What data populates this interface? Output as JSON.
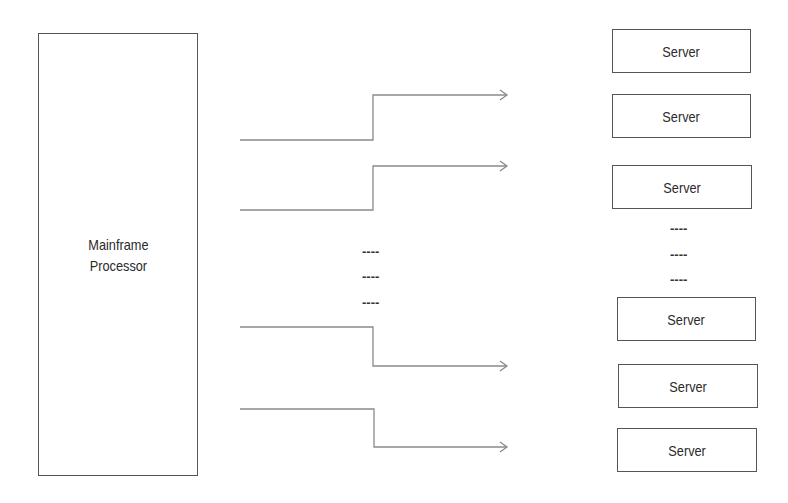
{
  "mainframe": {
    "label_line1": "Mainframe",
    "label_line2": "Processor"
  },
  "servers": [
    {
      "label": "Server"
    },
    {
      "label": "Server"
    },
    {
      "label": "Server"
    },
    {
      "label": "Server"
    },
    {
      "label": "Server"
    },
    {
      "label": "Server"
    }
  ],
  "ellipsis": {
    "middle": [
      "----",
      "----",
      "----"
    ],
    "right": [
      "----",
      "----",
      "----"
    ]
  },
  "connectors": [
    {
      "from": "mainframe",
      "to": "server",
      "direction": "up"
    },
    {
      "from": "mainframe",
      "to": "server",
      "direction": "up"
    },
    {
      "from": "mainframe",
      "to": "server",
      "direction": "down"
    },
    {
      "from": "mainframe",
      "to": "server",
      "direction": "down"
    }
  ],
  "colors": {
    "line": "#8a8a8a",
    "border": "#555555",
    "text": "#2a2a2a"
  }
}
